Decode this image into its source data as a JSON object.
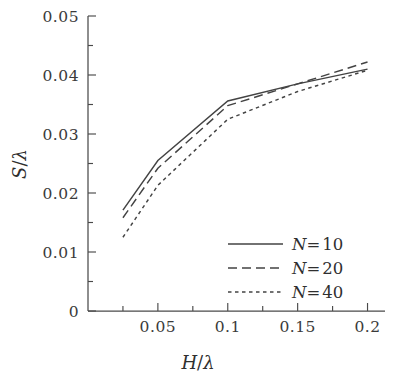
{
  "chart_data": {
    "type": "line",
    "title": "",
    "xlabel": "H/λ",
    "ylabel": "S/λ",
    "xlim": [
      0,
      0.2125
    ],
    "ylim": [
      0,
      0.05
    ],
    "grid": false,
    "legend_position": "bottom-right",
    "x_major_ticks": [
      0.05,
      0.1,
      0.15,
      0.2
    ],
    "x_major_tick_labels": [
      "0.05",
      "0.1",
      "0.15",
      "0.2"
    ],
    "x_minor_ticks": [
      0.025,
      0.075,
      0.125,
      0.175
    ],
    "y_major_ticks": [
      0,
      0.01,
      0.02,
      0.03,
      0.04,
      0.05
    ],
    "y_major_tick_labels": [
      "0",
      "0.01",
      "0.02",
      "0.03",
      "0.04",
      "0.05"
    ],
    "y_minor_ticks": [
      0.005,
      0.015,
      0.025,
      0.035,
      0.045
    ],
    "x": [
      0.025,
      0.05,
      0.1,
      0.15,
      0.2
    ],
    "series": [
      {
        "name": "N= 10",
        "style": "solid",
        "color": "#434343",
        "values": [
          0.0171,
          0.0255,
          0.0356,
          0.0385,
          0.041
        ]
      },
      {
        "name": "N= 20",
        "style": "dashed",
        "color": "#434343",
        "values": [
          0.0158,
          0.0242,
          0.0348,
          0.0385,
          0.0422
        ]
      },
      {
        "name": "N= 40",
        "style": "dotted",
        "color": "#434343",
        "values": [
          0.0125,
          0.0213,
          0.0325,
          0.0372,
          0.0408
        ]
      }
    ]
  },
  "legend": {
    "items": [
      {
        "label": "N= 10"
      },
      {
        "label": "N= 20"
      },
      {
        "label": "N= 40"
      }
    ]
  },
  "axes": {
    "x_title": "H/λ",
    "y_title": "S/λ"
  }
}
